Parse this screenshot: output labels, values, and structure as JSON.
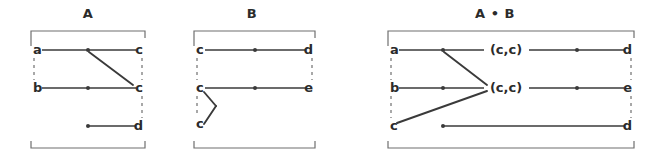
{
  "figure": {
    "type": "diagram",
    "background_color": "#ffffff",
    "ink_color": "#3a3a3a",
    "bracket_color": "#6f6f6f",
    "panels": [
      {
        "id": "panel-a",
        "title": "A",
        "title_x": 88,
        "bracket": {
          "x1": 31,
          "x2": 145,
          "y1": 31,
          "y2": 148,
          "tick": 7
        },
        "left_labels": [
          {
            "text": "a",
            "x": 33,
            "y": 50
          },
          {
            "text": "b",
            "x": 33,
            "y": 88
          }
        ],
        "right_labels": [
          {
            "text": "c",
            "x": 143,
            "y": 50
          },
          {
            "text": "c",
            "x": 143,
            "y": 88
          },
          {
            "text": "d",
            "x": 143,
            "y": 126
          }
        ],
        "rows": [
          {
            "y": 50,
            "x_from": 42,
            "x_to": 136,
            "dot_x": 88
          },
          {
            "y": 88,
            "x_from": 42,
            "x_to": 136,
            "dot_x": 88
          },
          {
            "y": 126,
            "x_from": 88,
            "x_to": 136,
            "dot_x": 88
          }
        ],
        "diagonals": [
          {
            "x1": 89,
            "y1": 52,
            "x2": 133,
            "y2": 85
          }
        ],
        "side_dashes": [
          {
            "x": 34,
            "y1": 58,
            "y2": 80
          },
          {
            "x": 142,
            "y1": 58,
            "y2": 80
          },
          {
            "x": 142,
            "y1": 96,
            "y2": 118
          }
        ]
      },
      {
        "id": "panel-b",
        "title": "B",
        "title_x": 252,
        "bracket": {
          "x1": 194,
          "x2": 315,
          "y1": 31,
          "y2": 148,
          "tick": 7
        },
        "left_labels": [
          {
            "text": "c",
            "x": 196,
            "y": 50
          },
          {
            "text": "c",
            "x": 196,
            "y": 88
          },
          {
            "text": "c",
            "x": 196,
            "y": 124
          }
        ],
        "right_labels": [
          {
            "text": "d",
            "x": 313,
            "y": 50
          },
          {
            "text": "e",
            "x": 313,
            "y": 88
          }
        ],
        "rows": [
          {
            "y": 50,
            "x_from": 205,
            "x_to": 306,
            "dot_x": 255
          },
          {
            "y": 88,
            "x_from": 205,
            "x_to": 306,
            "dot_x": 255
          }
        ],
        "diagonals": [
          {
            "x1": 204,
            "y1": 92,
            "x2": 216,
            "y2": 106
          },
          {
            "x1": 216,
            "y1": 106,
            "x2": 204,
            "y2": 124
          }
        ],
        "side_dashes": [
          {
            "x": 197,
            "y1": 58,
            "y2": 80
          },
          {
            "x": 197,
            "y1": 96,
            "y2": 116
          },
          {
            "x": 312,
            "y1": 58,
            "y2": 80
          }
        ]
      },
      {
        "id": "panel-ab",
        "title": "A • B",
        "title_x": 495,
        "bracket": {
          "x1": 388,
          "x2": 634,
          "y1": 31,
          "y2": 148,
          "tick": 7
        },
        "left_labels": [
          {
            "text": "a",
            "x": 390,
            "y": 50
          },
          {
            "text": "b",
            "x": 390,
            "y": 88
          },
          {
            "text": "c",
            "x": 390,
            "y": 126
          }
        ],
        "right_labels": [
          {
            "text": "d",
            "x": 632,
            "y": 50
          },
          {
            "text": "e",
            "x": 632,
            "y": 88
          },
          {
            "text": "d",
            "x": 632,
            "y": 126
          }
        ],
        "mid_labels": [
          {
            "text": "(c,c)",
            "x": 506,
            "y": 50
          },
          {
            "text": "(c,c)",
            "x": 506,
            "y": 88
          }
        ],
        "rows": [
          {
            "y": 50,
            "x_from": 399,
            "x_to": 484,
            "dot_x": 443
          },
          {
            "y": 50,
            "x_from": 529,
            "x_to": 624,
            "dot_x": 577
          },
          {
            "y": 88,
            "x_from": 399,
            "x_to": 484,
            "dot_x": 443
          },
          {
            "y": 88,
            "x_from": 529,
            "x_to": 624,
            "dot_x": 577
          },
          {
            "y": 126,
            "x_from": 443,
            "x_to": 624,
            "dot_x": 443
          }
        ],
        "diagonals": [
          {
            "x1": 444,
            "y1": 52,
            "x2": 487,
            "y2": 85
          },
          {
            "x1": 487,
            "y1": 91,
            "x2": 397,
            "y2": 123
          }
        ],
        "side_dashes": [
          {
            "x": 391,
            "y1": 58,
            "y2": 80
          },
          {
            "x": 391,
            "y1": 96,
            "y2": 118
          },
          {
            "x": 631,
            "y1": 58,
            "y2": 80
          },
          {
            "x": 631,
            "y1": 96,
            "y2": 118
          }
        ]
      }
    ]
  }
}
